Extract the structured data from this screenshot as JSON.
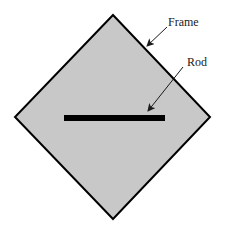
{
  "diagram": {
    "type": "schematic",
    "labels": {
      "frame": "Frame",
      "rod": "Rod"
    },
    "shapes": {
      "frame": {
        "shape": "diamond",
        "vertices": [
          [
            113,
            15
          ],
          [
            210,
            117
          ],
          [
            113,
            219
          ],
          [
            15,
            117
          ]
        ],
        "fill": "#c8c8c8",
        "stroke": "#000000",
        "stroke_width": 2
      },
      "rod": {
        "shape": "bar",
        "x1": 64,
        "x2": 165,
        "y": 118,
        "thickness": 6,
        "color": "#000000"
      }
    },
    "arrows": [
      {
        "label": "Frame",
        "from": [
          167,
          27
        ],
        "to": [
          147,
          46
        ]
      },
      {
        "label": "Rod",
        "from": [
          183,
          67
        ],
        "to": [
          148,
          111
        ]
      }
    ]
  }
}
